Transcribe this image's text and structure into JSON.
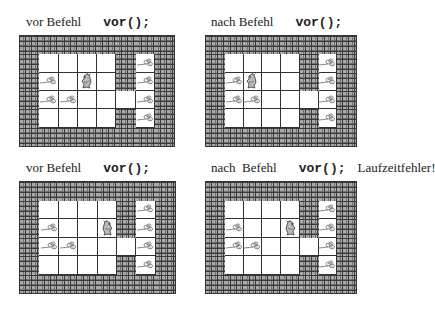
{
  "colors": {
    "wall_dark": "#3a3a3a",
    "wall_brick": "#a9a9a9",
    "grid_line": "#333333",
    "floor": "#ffffff",
    "grain": "#8a8a8a",
    "hamster": "#555555"
  },
  "panels": [
    {
      "id": "p1",
      "caption": {
        "prefix": "vor Befehl",
        "command": "vor();",
        "suffix": ""
      },
      "x": 19,
      "y": 35,
      "w": 156,
      "h": 112,
      "caption_x": 26,
      "caption_y": 14,
      "hamster": {
        "row": 1,
        "col": 2,
        "facing": "west"
      }
    },
    {
      "id": "p2",
      "caption": {
        "prefix": "nach Befehl",
        "command": "vor();",
        "suffix": ""
      },
      "x": 205,
      "y": 35,
      "w": 152,
      "h": 112,
      "caption_x": 211,
      "caption_y": 14,
      "hamster": {
        "row": 1,
        "col": 1,
        "facing": "west"
      }
    },
    {
      "id": "p3",
      "caption": {
        "prefix": "vor Befehl",
        "command": "vor();",
        "suffix": ""
      },
      "x": 19,
      "y": 181,
      "w": 157,
      "h": 113,
      "caption_x": 26,
      "caption_y": 160,
      "hamster": {
        "row": 1,
        "col": 3,
        "facing": "east"
      }
    },
    {
      "id": "p4",
      "caption": {
        "prefix": "nach  Befehl",
        "command": "vor();",
        "suffix": "Laufzeitfehler!"
      },
      "x": 205,
      "y": 181,
      "w": 152,
      "h": 113,
      "caption_x": 211,
      "caption_y": 160,
      "hamster": {
        "row": 1,
        "col": 3,
        "facing": "east"
      }
    }
  ],
  "territory": {
    "rows": 4,
    "cols": 6,
    "inner_walls": [
      [
        0,
        4
      ],
      [
        1,
        4
      ],
      [
        3,
        4
      ]
    ],
    "grains": [
      [
        0,
        5
      ],
      [
        1,
        0
      ],
      [
        1,
        5
      ],
      [
        2,
        0
      ],
      [
        2,
        1
      ],
      [
        2,
        5
      ],
      [
        3,
        5
      ]
    ]
  }
}
